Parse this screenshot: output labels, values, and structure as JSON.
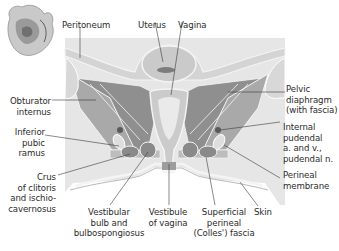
{
  "figure": {
    "colors": {
      "background_panel": "#e6e6e6",
      "muscle": "#a9a9a9",
      "muscle_dark": "#8f8f8f",
      "fascia_line": "#f4f4f4",
      "bone": "#d8d8d8",
      "organ": "#cfcfcf",
      "leader": "#3a3a3a"
    },
    "labels": {
      "peritoneum": "Peritoneum",
      "uterus": "Uterus",
      "vagina": "Vagina",
      "pelvic_diaphragm": [
        "Pelvic",
        "diaphragm",
        "(with fascia)"
      ],
      "obturator_internus": [
        "Obturator",
        "internus"
      ],
      "internal_pudendal": [
        "Internal",
        "pudendal",
        "a. and v.,",
        "pudendal n."
      ],
      "inferior_pubic_ramus": [
        "Inferior",
        "pubic",
        "ramus"
      ],
      "perineal_membrane": [
        "Perineal",
        "membrane"
      ],
      "crus_of_clitoris": [
        "Crus",
        "of clitoris",
        "and ischio-",
        "cavernosus"
      ],
      "vestibular_bulb": [
        "Vestibular",
        "bulb and",
        "bulbospongiosus"
      ],
      "vestibule_of_vagina": [
        "Vestibule",
        "of vagina"
      ],
      "superficial_perineal_fascia": [
        "Superficial",
        "perineal",
        "(Colles') fascia"
      ],
      "skin": "Skin"
    },
    "thumbnail": "pelvis-orientation-thumbnail"
  }
}
